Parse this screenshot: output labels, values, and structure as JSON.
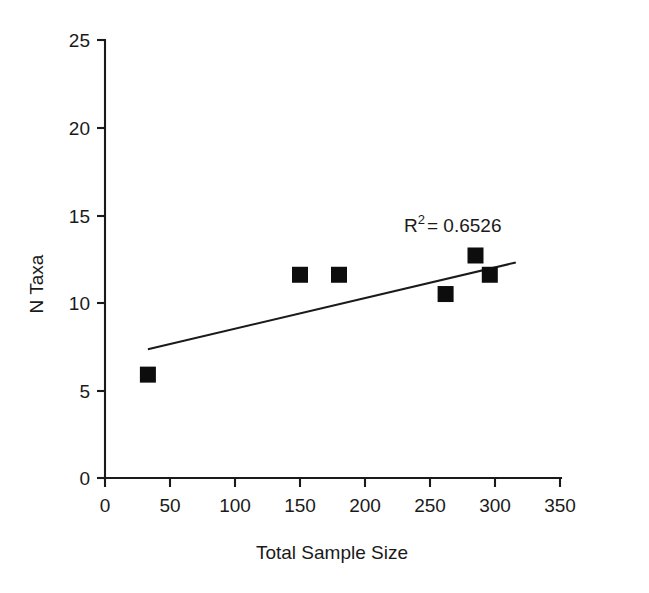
{
  "chart_data": {
    "type": "scatter",
    "title": "",
    "xlabel": "Total Sample Size",
    "ylabel": "N Taxa",
    "xlim": [
      0,
      350
    ],
    "ylim": [
      0,
      25
    ],
    "xticks": [
      0,
      50,
      100,
      150,
      200,
      250,
      300,
      350
    ],
    "yticks": [
      0,
      5,
      10,
      15,
      20,
      25
    ],
    "xtick_labels": [
      "0",
      "50",
      "100",
      "150",
      "200",
      "250",
      "300",
      "350"
    ],
    "ytick_labels": [
      "0",
      "5",
      "10",
      "15",
      "20",
      "25"
    ],
    "grid": false,
    "legend": null,
    "marker_shape": "square",
    "marker_color": "#0d0d0d",
    "points": [
      {
        "x": 33,
        "y": 5.9
      },
      {
        "x": 150,
        "y": 11.6
      },
      {
        "x": 180,
        "y": 11.6
      },
      {
        "x": 262,
        "y": 10.5
      },
      {
        "x": 285,
        "y": 12.7
      },
      {
        "x": 296,
        "y": 11.6
      }
    ],
    "trendline": {
      "type": "linear",
      "x_start": 33,
      "y_start": 7.35,
      "x_end": 316,
      "y_end": 12.3,
      "color": "#1a1a1a"
    },
    "annotations": [
      {
        "name": "r-squared",
        "base": "R",
        "superscript": "2",
        "rest": "= 0.6526",
        "full_text": "R2 = 0.6526",
        "x": 241,
        "y": 14.3
      }
    ]
  }
}
